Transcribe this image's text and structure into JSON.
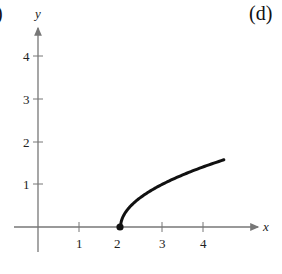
{
  "panel_labels": {
    "left": ")",
    "right": "(d)"
  },
  "chart_data": {
    "type": "line",
    "title": "",
    "function": "y = sqrt(x - 2)",
    "xlabel": "x",
    "ylabel": "y",
    "xlim": [
      -0.5,
      4.8
    ],
    "ylim": [
      -0.6,
      4.8
    ],
    "x_ticks": [
      "1",
      "2",
      "3",
      "4"
    ],
    "y_ticks": [
      "1",
      "2",
      "3",
      "4"
    ],
    "grid": false,
    "legend": null,
    "series": [
      {
        "name": "curve",
        "x": [
          2,
          2.05,
          2.2,
          2.5,
          3,
          3.5,
          4,
          4.5
        ],
        "y": [
          0,
          0.22,
          0.45,
          0.71,
          1.0,
          1.22,
          1.41,
          1.58
        ],
        "start_point": {
          "x": 2,
          "y": 0,
          "marker": "filled-dot"
        }
      }
    ],
    "colors": {
      "axis": "#777777",
      "curve": "#111111"
    }
  }
}
